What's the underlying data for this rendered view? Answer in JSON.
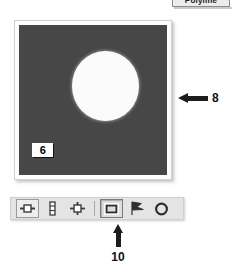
{
  "tooltip": {
    "text": "Polyline"
  },
  "image_panel": {
    "roi_label": "6",
    "background_color": "#474747",
    "blob_color": "#fbfbfb",
    "frame_color": "#fdfdfd"
  },
  "annotations": [
    {
      "number": "8",
      "direction": "left",
      "target": "image-panel"
    },
    {
      "number": "10",
      "direction": "up",
      "target": "rectangle-roi-tool"
    }
  ],
  "toolbar": {
    "items": [
      {
        "icon": "horizontal-profile-icon",
        "label": "Horizontal Profile",
        "state": "framed"
      },
      {
        "icon": "vertical-profile-icon",
        "label": "Vertical Profile",
        "state": "normal"
      },
      {
        "icon": "cross-profile-icon",
        "label": "Cross Profile",
        "state": "normal"
      },
      {
        "icon": "separator",
        "label": "",
        "state": "separator"
      },
      {
        "icon": "rectangle-roi-icon",
        "label": "Rectangle ROI",
        "state": "active"
      },
      {
        "icon": "polygon-roi-icon",
        "label": "Polygon ROI",
        "state": "normal"
      },
      {
        "icon": "ellipse-roi-icon",
        "label": "Ellipse ROI",
        "state": "normal"
      }
    ]
  },
  "colors": {
    "toolbar_background": "#e4e4e4",
    "annotation_ink": "#1c1c1c",
    "canvas_dark": "#474747"
  }
}
